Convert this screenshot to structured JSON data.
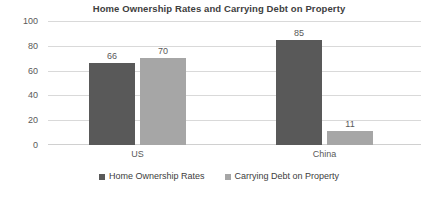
{
  "chart_data": {
    "type": "bar",
    "title": "Home Ownership Rates and Carrying Debt on Property",
    "subtitle": "",
    "xlabel": "",
    "ylabel": "",
    "categories": [
      "US",
      "China"
    ],
    "series": [
      {
        "name": "Home Ownership Rates",
        "color": "#595959",
        "values": [
          66,
          70
        ]
      },
      {
        "name": "Carrying Debt on Property",
        "color": "#a6a6a6",
        "values": [
          85,
          11
        ]
      }
    ],
    "bars": [
      {
        "category": "US",
        "series": "Home Ownership Rates",
        "value": 66,
        "label": "66"
      },
      {
        "category": "US",
        "series": "Carrying Debt on Property",
        "value": 70,
        "label": "70"
      },
      {
        "category": "China",
        "series": "Home Ownership Rates",
        "value": 85,
        "label": "85"
      },
      {
        "category": "China",
        "series": "Carrying Debt on Property",
        "value": 11,
        "label": "11"
      }
    ],
    "ylim": [
      0,
      100
    ],
    "yticks": [
      0,
      20,
      40,
      60,
      80,
      100
    ],
    "ytick_labels": [
      "0",
      "20",
      "40",
      "60",
      "80",
      "100"
    ],
    "grid": true,
    "grid_color": "#d9d9d9",
    "legend_position": "bottom",
    "background": "#ffffff"
  },
  "legend": {
    "items": [
      {
        "label": "Home Ownership Rates"
      },
      {
        "label": "Carrying Debt on Property"
      }
    ]
  },
  "axis": {
    "y_labels": [
      "100",
      "80",
      "60",
      "40",
      "20",
      "0"
    ],
    "x_labels": [
      "US",
      "China"
    ]
  }
}
